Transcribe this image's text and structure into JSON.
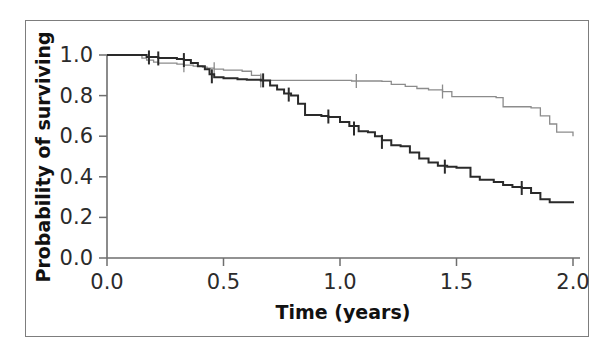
{
  "figure": {
    "background_color": "#ffffff",
    "frame_color": "#7d7d7d"
  },
  "chart_data": {
    "type": "line",
    "title": "",
    "subtitle": "",
    "xlabel": "Time (years)",
    "ylabel": "Probability of surviving",
    "xlim": [
      0.0,
      2.0
    ],
    "ylim": [
      0.0,
      1.0
    ],
    "grid": false,
    "legend_position": "none",
    "xticks": [
      0.0,
      0.5,
      1.0,
      1.5,
      2.0
    ],
    "xtick_labels": [
      "0.0",
      "0.5",
      "1.0",
      "1.5",
      "2.0"
    ],
    "yticks": [
      0.0,
      0.2,
      0.4,
      0.6,
      0.8,
      1.0
    ],
    "ytick_labels": [
      "0.0",
      "0.2",
      "0.4",
      "0.6",
      "0.8",
      "1.0"
    ],
    "annotations": [
      "Kaplan-Meier survival curves with censoring tick marks"
    ],
    "series": [
      {
        "name": "upper-curve",
        "color": "#8c8c8c",
        "line_width": 1.3,
        "step": "post",
        "final_value": 0.6,
        "x": [
          0.0,
          0.13,
          0.15,
          0.17,
          0.2,
          0.22,
          0.3,
          0.33,
          0.37,
          0.41,
          0.43,
          0.46,
          0.5,
          0.58,
          0.62,
          0.66,
          1.02,
          1.05,
          1.18,
          1.22,
          1.28,
          1.33,
          1.38,
          1.44,
          1.48,
          1.67,
          1.7,
          1.82,
          1.86,
          1.9,
          1.93,
          2.0
        ],
        "y": [
          1.0,
          1.0,
          0.985,
          0.975,
          0.965,
          0.96,
          0.955,
          0.95,
          0.945,
          0.94,
          0.935,
          0.93,
          0.925,
          0.92,
          0.9,
          0.875,
          0.875,
          0.872,
          0.87,
          0.855,
          0.845,
          0.835,
          0.828,
          0.82,
          0.795,
          0.79,
          0.745,
          0.74,
          0.7,
          0.66,
          0.62,
          0.6
        ],
        "censor_marks": [
          {
            "x": 0.33,
            "y": 0.95
          },
          {
            "x": 0.46,
            "y": 0.93
          },
          {
            "x": 0.66,
            "y": 0.875
          },
          {
            "x": 1.07,
            "y": 0.872
          },
          {
            "x": 1.44,
            "y": 0.82
          }
        ]
      },
      {
        "name": "lower-curve",
        "color": "#2a2a2a",
        "line_width": 2.0,
        "step": "post",
        "final_value": 0.27,
        "x": [
          0.0,
          0.14,
          0.17,
          0.22,
          0.3,
          0.33,
          0.36,
          0.39,
          0.42,
          0.44,
          0.46,
          0.5,
          0.56,
          0.6,
          0.66,
          0.7,
          0.73,
          0.76,
          0.79,
          0.82,
          0.85,
          0.92,
          0.95,
          1.0,
          1.04,
          1.08,
          1.12,
          1.15,
          1.18,
          1.22,
          1.26,
          1.3,
          1.34,
          1.38,
          1.42,
          1.46,
          1.5,
          1.56,
          1.6,
          1.66,
          1.7,
          1.74,
          1.78,
          1.82,
          1.86,
          1.9,
          2.0
        ],
        "y": [
          1.0,
          1.0,
          0.99,
          0.985,
          0.98,
          0.975,
          0.96,
          0.945,
          0.93,
          0.905,
          0.89,
          0.885,
          0.88,
          0.878,
          0.875,
          0.85,
          0.83,
          0.81,
          0.8,
          0.76,
          0.705,
          0.7,
          0.695,
          0.67,
          0.65,
          0.625,
          0.62,
          0.6,
          0.58,
          0.555,
          0.55,
          0.52,
          0.49,
          0.47,
          0.455,
          0.45,
          0.445,
          0.4,
          0.385,
          0.375,
          0.36,
          0.35,
          0.345,
          0.32,
          0.29,
          0.275,
          0.27
        ],
        "censor_marks": [
          {
            "x": 0.18,
            "y": 0.988
          },
          {
            "x": 0.22,
            "y": 0.983
          },
          {
            "x": 0.33,
            "y": 0.975
          },
          {
            "x": 0.45,
            "y": 0.895
          },
          {
            "x": 0.67,
            "y": 0.875
          },
          {
            "x": 0.78,
            "y": 0.805
          },
          {
            "x": 0.95,
            "y": 0.697
          },
          {
            "x": 1.06,
            "y": 0.638
          },
          {
            "x": 1.18,
            "y": 0.572
          },
          {
            "x": 1.45,
            "y": 0.45
          },
          {
            "x": 1.78,
            "y": 0.345
          }
        ]
      }
    ]
  },
  "axes": {
    "x_axis_name": "time-axis",
    "y_axis_name": "probability-axis"
  }
}
